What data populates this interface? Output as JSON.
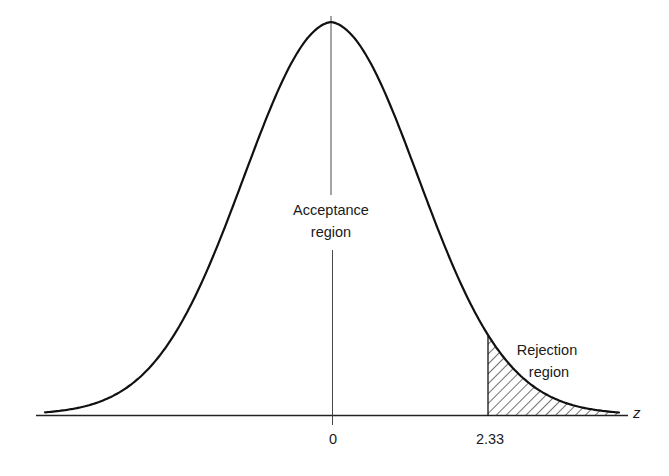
{
  "chart_data": {
    "type": "area",
    "title": "",
    "xlabel": "z",
    "ylabel": "",
    "x_ticks": [
      {
        "value": 0,
        "label": "0"
      },
      {
        "value": 2.33,
        "label": "2.33"
      }
    ],
    "critical_value": 2.33,
    "regions": [
      {
        "name": "acceptance",
        "label_line1": "Acceptance",
        "label_line2": "region",
        "range": [
          "-inf",
          2.33
        ],
        "shaded": false
      },
      {
        "name": "rejection",
        "label_line1": "Rejection",
        "label_line2": "region",
        "range": [
          2.33,
          "inf"
        ],
        "shaded": true,
        "pattern": "diagonal-hatch"
      }
    ],
    "grid": false,
    "legend": "none",
    "colors": {
      "line": "#111111",
      "background": "#ffffff"
    }
  },
  "labels": {
    "acceptance_1": "Acceptance",
    "acceptance_2": "region",
    "rejection_1": "Rejection",
    "rejection_2": "region",
    "tick_zero": "0",
    "tick_crit": "2.33",
    "axis_z": "z"
  }
}
